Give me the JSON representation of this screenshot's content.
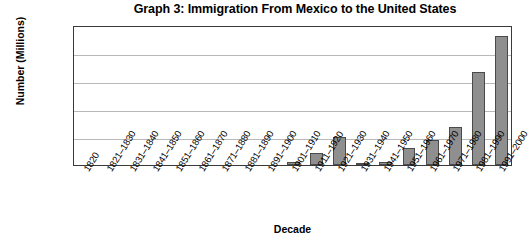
{
  "chart_data": {
    "type": "bar",
    "title": "Graph 3: Immigration From Mexico to the United States",
    "xlabel": "Decade",
    "ylabel": "Number (Millions)",
    "ylim": [
      0,
      2.5
    ],
    "ytick_labels": [
      "2.5",
      "2",
      "1.5",
      "1",
      "0.5",
      "0"
    ],
    "ytick_values": [
      2.5,
      2,
      1.5,
      1,
      0.5,
      0
    ],
    "grid": "horizontal",
    "legend": "none",
    "bar_color": "#8f8f8f",
    "bar_edge_color": "#4a4a4a",
    "categories": [
      "1820",
      "1821–1830",
      "1831–1840",
      "1841–1850",
      "1851–1860",
      "1861–1870",
      "1871–1880",
      "1881–1890",
      "1891–1900",
      "1901–1910",
      "1911–1920",
      "1921–1930",
      "1931–1940",
      "1941–1950",
      "1951–1960",
      "1961–1970",
      "1971–1980",
      "1981–1990",
      "1991–2000"
    ],
    "values": [
      0,
      0,
      0,
      0,
      0,
      0,
      0,
      0,
      0,
      0.05,
      0.22,
      0.5,
      0.03,
      0.06,
      0.3,
      0.45,
      0.68,
      1.66,
      2.3
    ]
  }
}
